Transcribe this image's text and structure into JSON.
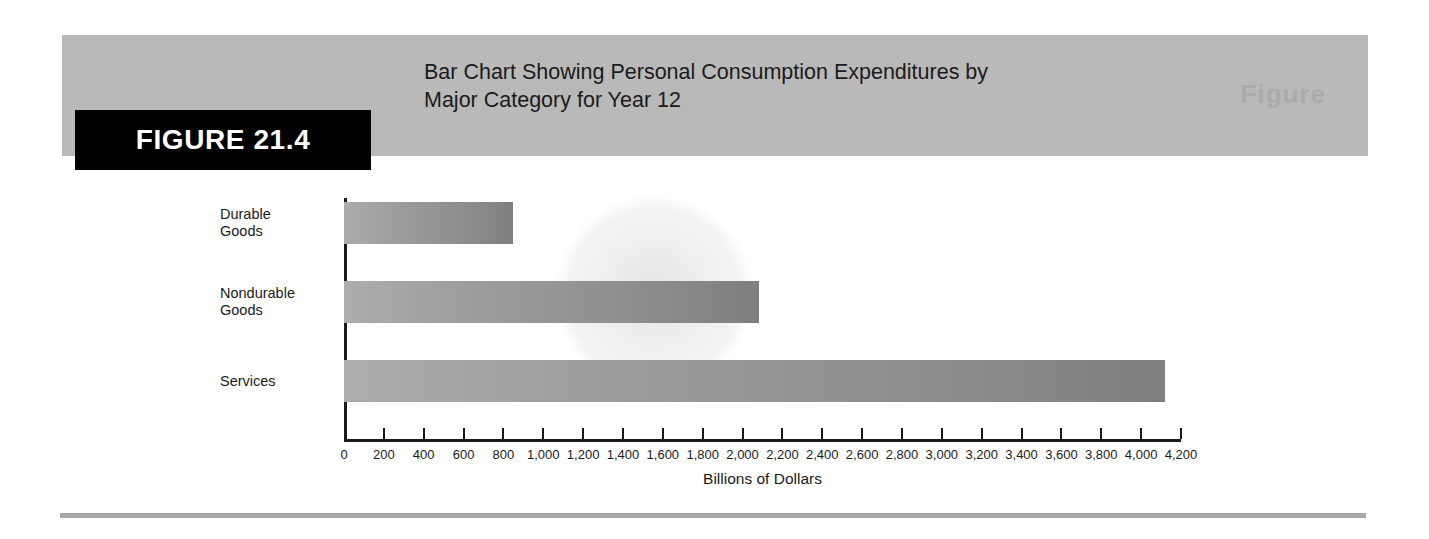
{
  "figure": {
    "badge_label": "FIGURE 21.4",
    "watermark": "Figure",
    "title_line_1": "Bar Chart Showing Personal Consumption Expenditures by",
    "title_line_2": "Major Category for Year 12",
    "title_full": "Bar Chart Showing Personal Consumption Expenditures by Major Category for Year 12"
  },
  "colors": {
    "header_band": "#b9b9b9",
    "badge_background": "#000000",
    "badge_text": "#ffffff",
    "bar_light": "#adadad",
    "bar_dark": "#7f7f7f",
    "axis": "#1a1a1a",
    "rule": "#a8a8a8"
  },
  "chart_data": {
    "type": "bar",
    "orientation": "horizontal",
    "title": "Bar Chart Showing Personal Consumption Expenditures by Major Category for Year 12",
    "categories": [
      "Durable Goods",
      "Nondurable Goods",
      "Services"
    ],
    "category_lines": [
      [
        "Durable",
        "Goods"
      ],
      [
        "Nondurable",
        "Goods"
      ],
      [
        "Services"
      ]
    ],
    "values": [
      850,
      2080,
      4120
    ],
    "xlabel": "Billions of Dollars",
    "ylabel": "",
    "xlim": [
      0,
      4200
    ],
    "xtick_step": 200,
    "xticks": [
      0,
      200,
      400,
      600,
      800,
      1000,
      1200,
      1400,
      1600,
      1800,
      2000,
      2200,
      2400,
      2600,
      2800,
      3000,
      3200,
      3400,
      3600,
      3800,
      4000,
      4200
    ],
    "xticklabels": [
      "0",
      "200",
      "400",
      "600",
      "800",
      "1,000",
      "1,200",
      "1,400",
      "1,600",
      "1,800",
      "2,000",
      "2,200",
      "2,400",
      "2,600",
      "2,800",
      "3,000",
      "3,200",
      "3,400",
      "3,600",
      "3,800",
      "4,000",
      "4,200"
    ],
    "grid": false,
    "legend": false
  }
}
